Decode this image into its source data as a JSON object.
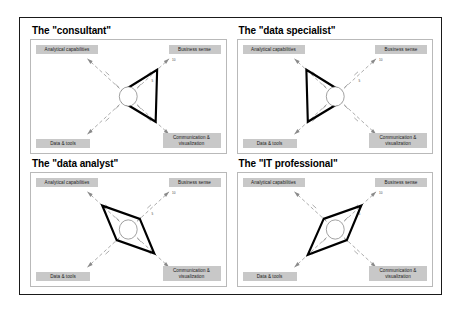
{
  "figure": {
    "axis_labels": {
      "top_left": "Analytical capabilities",
      "top_right": "Business sense",
      "bottom_left": "Data & tools",
      "bottom_right": "Communication &\nvisualization"
    },
    "tick_labels": {
      "outer": "10",
      "inner": "5"
    },
    "colors": {
      "label_box": "#c8c8c8",
      "polygon_stroke": "#000000",
      "axis_line": "#8a8a8a",
      "panel_border": "#b9b9b9",
      "page_border": "#1a1a1a",
      "background": "#ffffff"
    }
  },
  "chart_data": {
    "type": "radar",
    "xlabel": "",
    "ylabel": "",
    "grid": false,
    "legend_position": "none",
    "axes": [
      "Analytical capabilities",
      "Business sense",
      "Communication & visualization",
      "Data & tools"
    ],
    "axis_angles_deg": [
      135,
      45,
      315,
      225
    ],
    "rlim": [
      0,
      10
    ],
    "rticks": [
      5,
      10
    ],
    "series": [
      {
        "name": "The \"consultant\"",
        "values": [
          2.0,
          10.0,
          9.5,
          2.0
        ]
      },
      {
        "name": "The \"data specialist\"",
        "values": [
          10.0,
          2.0,
          2.0,
          9.5
        ]
      },
      {
        "name": "The \"data analyst\"",
        "values": [
          9.0,
          4.0,
          9.0,
          4.0
        ]
      },
      {
        "name": "The \"IT professional\"",
        "values": [
          4.0,
          9.0,
          4.0,
          9.5
        ]
      }
    ]
  },
  "panels": [
    {
      "id": "consultant",
      "title": "The \"consultant\""
    },
    {
      "id": "data-specialist",
      "title": "The \"data specialist\""
    },
    {
      "id": "data-analyst",
      "title": "The \"data analyst\""
    },
    {
      "id": "it-professional",
      "title": "The \"IT professional\""
    }
  ]
}
